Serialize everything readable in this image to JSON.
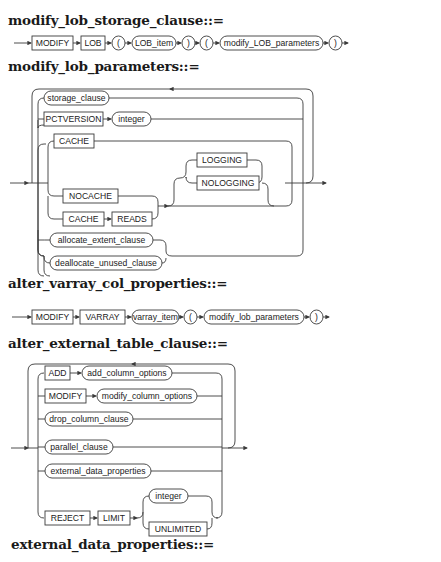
{
  "diagrams": [
    {
      "title": "modify_lob_storage_clause::=",
      "nodes": [
        {
          "kind": "keyword",
          "label": "MODIFY"
        },
        {
          "kind": "keyword",
          "label": "LOB"
        },
        {
          "kind": "symbol",
          "label": "("
        },
        {
          "kind": "nonterminal",
          "label": "LOB_item"
        },
        {
          "kind": "symbol",
          "label": ")"
        },
        {
          "kind": "symbol",
          "label": "("
        },
        {
          "kind": "nonterminal",
          "label": "modify_LOB_parameters"
        },
        {
          "kind": "symbol",
          "label": ")"
        }
      ]
    },
    {
      "title": "modify_lob_parameters::=",
      "nodes": [
        {
          "kind": "nonterminal",
          "label": "storage_clause"
        },
        {
          "kind": "keyword",
          "label": "PCTVERSION"
        },
        {
          "kind": "nonterminal",
          "label": "integer"
        },
        {
          "kind": "keyword",
          "label": "CACHE"
        },
        {
          "kind": "keyword",
          "label": "LOGGING"
        },
        {
          "kind": "keyword",
          "label": "NOLOGGING"
        },
        {
          "kind": "keyword",
          "label": "NOCACHE"
        },
        {
          "kind": "keyword",
          "label": "CACHE"
        },
        {
          "kind": "keyword",
          "label": "READS"
        },
        {
          "kind": "nonterminal",
          "label": "allocate_extent_clause"
        },
        {
          "kind": "nonterminal",
          "label": "deallocate_unused_clause"
        }
      ]
    },
    {
      "title": "alter_varray_col_properties::=",
      "nodes": [
        {
          "kind": "keyword",
          "label": "MODIFY"
        },
        {
          "kind": "keyword",
          "label": "VARRAY"
        },
        {
          "kind": "nonterminal",
          "label": "varray_item"
        },
        {
          "kind": "symbol",
          "label": "("
        },
        {
          "kind": "nonterminal",
          "label": "modify_lob_parameters"
        },
        {
          "kind": "symbol",
          "label": ")"
        }
      ]
    },
    {
      "title": "alter_external_table_clause::=",
      "nodes": [
        {
          "kind": "keyword",
          "label": "ADD"
        },
        {
          "kind": "nonterminal",
          "label": "add_column_options"
        },
        {
          "kind": "keyword",
          "label": "MODIFY"
        },
        {
          "kind": "nonterminal",
          "label": "modify_column_options"
        },
        {
          "kind": "nonterminal",
          "label": "drop_column_clause"
        },
        {
          "kind": "nonterminal",
          "label": "parallel_clause"
        },
        {
          "kind": "nonterminal",
          "label": "external_data_properties"
        },
        {
          "kind": "keyword",
          "label": "REJECT"
        },
        {
          "kind": "keyword",
          "label": "LIMIT"
        },
        {
          "kind": "nonterminal",
          "label": "integer"
        },
        {
          "kind": "keyword",
          "label": "UNLIMITED"
        }
      ]
    },
    {
      "title": "external_data_properties::=",
      "nodes": []
    }
  ],
  "colors": {
    "line": "#3a3a3a",
    "text": "#222222",
    "title": "#1a1a1a",
    "background": "#ffffff"
  }
}
